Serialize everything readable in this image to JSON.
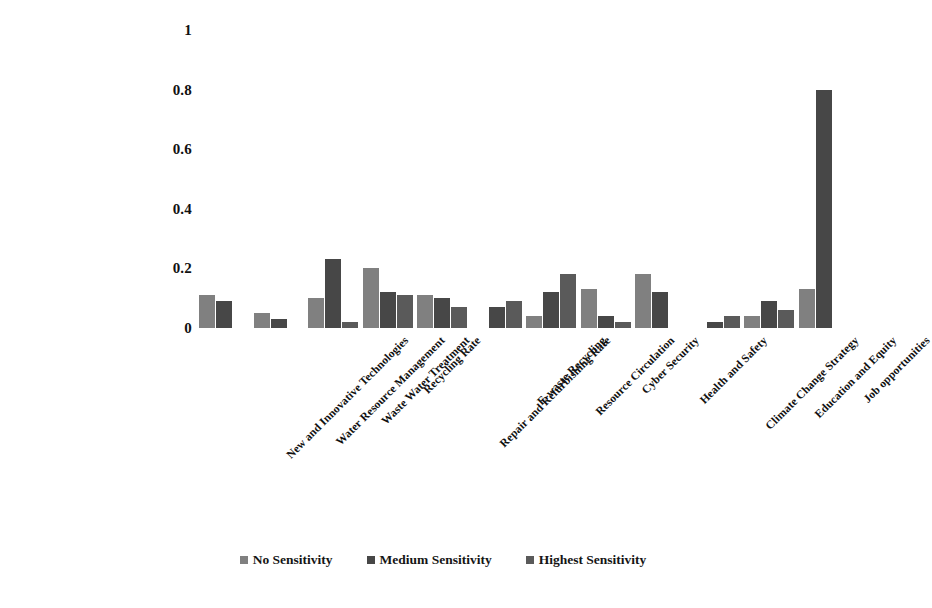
{
  "chart_data": {
    "type": "bar",
    "title": "",
    "subtitle": "",
    "xlabel": "",
    "ylabel": "",
    "ylim": [
      0,
      1
    ],
    "yticks": [
      "0",
      "0.2",
      "0.4",
      "0.6",
      "0.8",
      "1"
    ],
    "ytick_values": [
      0,
      0.2,
      0.4,
      0.6,
      0.8,
      1
    ],
    "grid": false,
    "legend_position": "bottom-center",
    "orientation": "vertical",
    "grouping": "clustered",
    "categories": [
      "New and Innovative Technologies",
      "Water Resource Management",
      "Waste Water Treatment",
      "Recycling Rate",
      "Repair and Refurbishing Rate",
      "E-waste Recycling",
      "Resource Circulation",
      "Cyber Security",
      "Health and Safety",
      "Climate Change Strategy",
      "Education and Equity",
      "Job opportunities"
    ],
    "series": [
      {
        "name": "No Sensitivity",
        "color": "#808080",
        "values": [
          0.11,
          0.05,
          0.1,
          0.2,
          0.11,
          0.0,
          0.04,
          0.13,
          0.18,
          0.0,
          0.04,
          0.13
        ]
      },
      {
        "name": "Medium Sensitivity",
        "color": "#474747",
        "values": [
          0.09,
          0.03,
          0.23,
          0.12,
          0.1,
          0.07,
          0.12,
          0.04,
          0.12,
          0.02,
          0.09,
          0.8
        ]
      },
      {
        "name": "Highest Sensitivity",
        "color": "#5a5a5a",
        "values": [
          0.0,
          0.0,
          0.02,
          0.11,
          0.07,
          0.09,
          0.21,
          0.02,
          0.0,
          0.04,
          0.06,
          0.0
        ]
      }
    ],
    "extra_series_note": {
      "name": "Highest Sensitivity (group 7 third bar)",
      "values": [
        0.18
      ]
    }
  },
  "legend": {
    "items": [
      {
        "label": "No Sensitivity",
        "color": "#808080"
      },
      {
        "label": "Medium Sensitivity",
        "color": "#474747"
      },
      {
        "label": "Highest Sensitivity",
        "color": "#5a5a5a"
      }
    ]
  },
  "colors": {
    "background": "#ffffff",
    "text": "#111111",
    "series_1": "#808080",
    "series_2": "#474747",
    "series_3": "#5a5a5a"
  }
}
